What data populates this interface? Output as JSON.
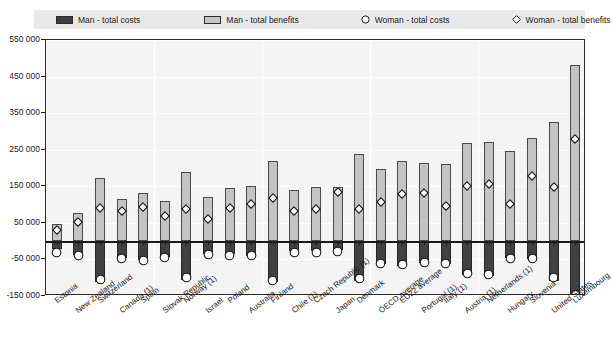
{
  "legend": {
    "items": [
      {
        "label": "Man - total costs",
        "marker": "filled-square-dark",
        "color": "#3d3d3d"
      },
      {
        "label": "Man - total benefits",
        "marker": "filled-square-light",
        "color": "#c6c6c6"
      },
      {
        "label": "Woman - total costs",
        "marker": "circle-outline",
        "color": "#ffffff"
      },
      {
        "label": "Woman - total benefits",
        "marker": "diamond-outline",
        "color": "#ffffff"
      }
    ]
  },
  "title_fragment": "",
  "chart_data": {
    "type": "bar",
    "title": "",
    "xlabel": "",
    "ylabel": "",
    "ylim": [
      -150000,
      550000
    ],
    "ytick_labels": [
      "550 000",
      "450 000",
      "350 000",
      "250 000",
      "150 000",
      "50 000",
      "-50 000",
      "-150 000"
    ],
    "ytick_values": [
      550000,
      450000,
      350000,
      250000,
      150000,
      50000,
      -50000,
      -150000
    ],
    "grid": true,
    "legend_position": "top",
    "categories": [
      "Estonia",
      "New Zealand",
      "Switzerland",
      "Canada (1)",
      "Spain",
      "Slovak Republic",
      "Norway (1)",
      "Israel",
      "Poland",
      "Australia",
      "Finland",
      "Chile (1)",
      "Czech Republic (1)",
      "Japan",
      "Denmark",
      "OECD average",
      "EU22 average",
      "Portugal (1)",
      "Italy (1)",
      "Austria (1)",
      "Netherlands (1)",
      "Hungary",
      "Slovenia",
      "United States",
      "Luxembourg"
    ],
    "series": [
      {
        "name": "Man - total benefits",
        "type": "bar",
        "values": [
          48000,
          78000,
          172000,
          116000,
          132000,
          110000,
          190000,
          122000,
          145000,
          150000,
          218000,
          140000,
          148000,
          148000,
          238000,
          196000,
          218000,
          215000,
          212000,
          268000,
          270000,
          246000,
          283000,
          325000,
          482000
        ]
      },
      {
        "name": "Man - total costs",
        "type": "bar",
        "values": [
          -22000,
          -38000,
          -112000,
          -45000,
          -52000,
          -42000,
          -105000,
          -35000,
          -36000,
          -40000,
          -112000,
          -28000,
          -28000,
          -24000,
          -108000,
          -62000,
          -68000,
          -60000,
          -62000,
          -92000,
          -95000,
          -45000,
          -48000,
          -108000,
          -148000
        ]
      },
      {
        "name": "Woman - total benefits",
        "type": "scatter",
        "marker": "diamond",
        "values": [
          42000,
          62000,
          102000,
          92000,
          105000,
          80000,
          100000,
          72000,
          102000,
          112000,
          130000,
          92000,
          98000,
          146000,
          100000,
          118000,
          140000,
          142000,
          106000,
          162000,
          168000,
          112000,
          188000,
          160000,
          290000
        ]
      },
      {
        "name": "Woman - total costs",
        "type": "scatter",
        "marker": "circle",
        "values": [
          -22000,
          -32000,
          -98000,
          -40000,
          -45000,
          -36000,
          -92000,
          -28000,
          -32000,
          -32000,
          -100000,
          -22000,
          -24000,
          -20000,
          -95000,
          -52000,
          -56000,
          -50000,
          -52000,
          -80000,
          -82000,
          -38000,
          -40000,
          -92000,
          -138000
        ]
      }
    ]
  },
  "colors": {
    "bar_benefits": "#c3c3c3",
    "bar_costs": "#414141",
    "plot_background": "#f4f4f4",
    "legend_background": "#e9e9e9",
    "axis": "#1a1a1a",
    "grid": "#ffffff"
  }
}
